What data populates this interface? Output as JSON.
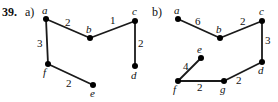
{
  "exercise": {
    "number": "39.",
    "parts": [
      {
        "label": "a)",
        "x": 25,
        "y": 5
      },
      {
        "label": "b)",
        "x": 152,
        "y": 5
      }
    ]
  },
  "colors": {
    "background": "#ffffff",
    "ink": "#111111",
    "edge": "#1a1a1a",
    "vertex": "#000000"
  },
  "graphs": [
    {
      "id": "graph-a",
      "vertices": [
        {
          "id": "a",
          "label": "a",
          "x": 46,
          "y": 19,
          "label_x": 42,
          "label_y": 5
        },
        {
          "id": "b",
          "label": "b",
          "x": 90,
          "y": 38,
          "label_x": 86,
          "label_y": 24
        },
        {
          "id": "c",
          "label": "c",
          "x": 135,
          "y": 21,
          "label_x": 132,
          "label_y": 6
        },
        {
          "id": "d",
          "label": "d",
          "x": 135,
          "y": 66,
          "label_x": 131,
          "label_y": 70
        },
        {
          "id": "e",
          "label": "e",
          "x": 93,
          "y": 85,
          "label_x": 90,
          "label_y": 88
        },
        {
          "id": "f",
          "label": "f",
          "x": 48,
          "y": 64,
          "label_x": 43,
          "label_y": 67
        }
      ],
      "edges": [
        {
          "from": "a",
          "to": "b",
          "weight": "2",
          "label_x": 65,
          "label_y": 17
        },
        {
          "from": "b",
          "to": "c",
          "weight": "1",
          "label_x": 110,
          "label_y": 15
        },
        {
          "from": "c",
          "to": "d",
          "weight": "2",
          "label_x": 138,
          "label_y": 38
        },
        {
          "from": "a",
          "to": "f",
          "weight": "3",
          "label_x": 37,
          "label_y": 38
        },
        {
          "from": "f",
          "to": "e",
          "weight": "2",
          "label_x": 66,
          "label_y": 78
        }
      ]
    },
    {
      "id": "graph-b",
      "vertices": [
        {
          "id": "a",
          "label": "a",
          "x": 178,
          "y": 19,
          "label_x": 174,
          "label_y": 5
        },
        {
          "id": "b",
          "label": "b",
          "x": 220,
          "y": 38,
          "label_x": 216,
          "label_y": 24
        },
        {
          "id": "c",
          "label": "c",
          "x": 262,
          "y": 21,
          "label_x": 259,
          "label_y": 6
        },
        {
          "id": "d",
          "label": "d",
          "x": 262,
          "y": 62,
          "label_x": 258,
          "label_y": 65
        },
        {
          "id": "e",
          "label": "e",
          "x": 201,
          "y": 58,
          "label_x": 197,
          "label_y": 44
        },
        {
          "id": "f",
          "label": "f",
          "x": 178,
          "y": 81,
          "label_x": 173,
          "label_y": 84
        },
        {
          "id": "g",
          "label": "g",
          "x": 224,
          "y": 81,
          "label_x": 220,
          "label_y": 84
        }
      ],
      "edges": [
        {
          "from": "a",
          "to": "b",
          "weight": "6",
          "label_x": 195,
          "label_y": 16
        },
        {
          "from": "b",
          "to": "c",
          "weight": "2",
          "label_x": 240,
          "label_y": 16
        },
        {
          "from": "c",
          "to": "d",
          "weight": "3",
          "label_x": 265,
          "label_y": 35
        },
        {
          "from": "d",
          "to": "g",
          "weight": "2",
          "label_x": 236,
          "label_y": 75
        },
        {
          "from": "f",
          "to": "g",
          "weight": "2",
          "label_x": 197,
          "label_y": 82
        },
        {
          "from": "f",
          "to": "e",
          "weight": "4",
          "label_x": 183,
          "label_y": 61
        }
      ]
    }
  ]
}
